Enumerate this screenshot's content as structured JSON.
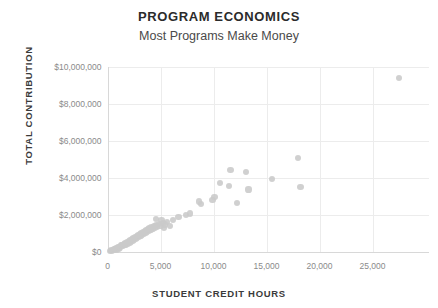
{
  "chart_data": {
    "type": "scatter",
    "title": "PROGRAM ECONOMICS",
    "subtitle": "Most Programs Make Money",
    "xlabel": "STUDENT CREDIT HOURS",
    "ylabel": "TOTAL CONTRIBUTION",
    "xlim": [
      0,
      27500
    ],
    "ylim": [
      0,
      10000000
    ],
    "grid": true,
    "legend": "none",
    "marker_color": "#c9c9c9",
    "xticks": [
      0,
      5000,
      10000,
      15000,
      20000,
      25000
    ],
    "xtick_labels": [
      "0",
      "5,000",
      "10,000",
      "15,000",
      "20,000",
      "25,000"
    ],
    "yticks": [
      0,
      2000000,
      4000000,
      6000000,
      8000000,
      10000000
    ],
    "ytick_labels": [
      "$0",
      "$2,000,000",
      "$4,000,000",
      "$6,000,000",
      "$8,000,000",
      "$10,000,000"
    ],
    "points": [
      [
        200,
        40000
      ],
      [
        350,
        60000
      ],
      [
        420,
        30000
      ],
      [
        500,
        90000
      ],
      [
        620,
        120000
      ],
      [
        700,
        80000
      ],
      [
        760,
        150000
      ],
      [
        850,
        180000
      ],
      [
        900,
        60000
      ],
      [
        980,
        220000
      ],
      [
        1050,
        160000
      ],
      [
        1120,
        260000
      ],
      [
        1200,
        210000
      ],
      [
        1260,
        320000
      ],
      [
        1330,
        280000
      ],
      [
        1400,
        350000
      ],
      [
        1480,
        300000
      ],
      [
        1550,
        420000
      ],
      [
        1620,
        380000
      ],
      [
        1700,
        450000
      ],
      [
        1780,
        330000
      ],
      [
        1850,
        500000
      ],
      [
        1920,
        430000
      ],
      [
        2000,
        560000
      ],
      [
        2080,
        480000
      ],
      [
        2150,
        610000
      ],
      [
        2230,
        530000
      ],
      [
        2300,
        660000
      ],
      [
        2380,
        580000
      ],
      [
        2450,
        720000
      ],
      [
        2520,
        640000
      ],
      [
        2600,
        770000
      ],
      [
        2680,
        690000
      ],
      [
        2750,
        830000
      ],
      [
        2820,
        750000
      ],
      [
        2900,
        880000
      ],
      [
        2980,
        800000
      ],
      [
        3050,
        930000
      ],
      [
        3120,
        860000
      ],
      [
        3200,
        990000
      ],
      [
        3280,
        910000
      ],
      [
        3350,
        1050000
      ],
      [
        3420,
        970000
      ],
      [
        3500,
        1100000
      ],
      [
        3580,
        1020000
      ],
      [
        3650,
        1160000
      ],
      [
        3720,
        1080000
      ],
      [
        3800,
        1210000
      ],
      [
        3880,
        1130000
      ],
      [
        3950,
        1270000
      ],
      [
        4050,
        1190000
      ],
      [
        4150,
        1320000
      ],
      [
        4250,
        1240000
      ],
      [
        4350,
        1380000
      ],
      [
        4450,
        1300000
      ],
      [
        4550,
        1430000
      ],
      [
        4700,
        1350000
      ],
      [
        4850,
        1490000
      ],
      [
        5000,
        1410000
      ],
      [
        5200,
        1540000
      ],
      [
        5400,
        1460000
      ],
      [
        5600,
        1600000
      ],
      [
        4600,
        1750000
      ],
      [
        5100,
        1700000
      ],
      [
        5350,
        1250000
      ],
      [
        5900,
        1380000
      ],
      [
        6200,
        1720000
      ],
      [
        6700,
        1880000
      ],
      [
        7400,
        1960000
      ],
      [
        7800,
        2050000
      ],
      [
        8600,
        2700000
      ],
      [
        8800,
        2580000
      ],
      [
        9900,
        2800000
      ],
      [
        10100,
        2950000
      ],
      [
        10600,
        3700000
      ],
      [
        11500,
        3550000
      ],
      [
        11600,
        4400000
      ],
      [
        12200,
        2600000
      ],
      [
        13100,
        4300000
      ],
      [
        13300,
        3350000
      ],
      [
        15500,
        3900000
      ],
      [
        18000,
        5050000
      ],
      [
        18200,
        3500000
      ],
      [
        27500,
        9400000
      ]
    ]
  }
}
